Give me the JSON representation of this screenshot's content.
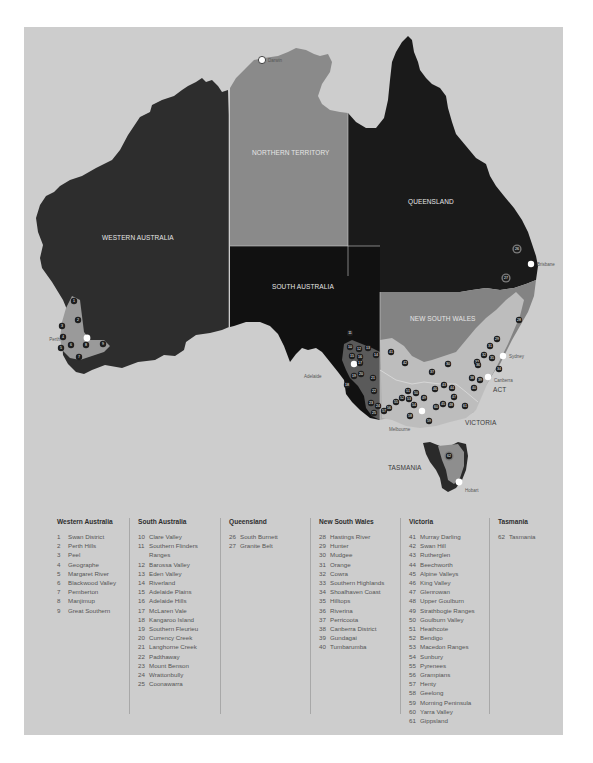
{
  "map": {
    "colors": {
      "background": "#cdcdcd",
      "western_australia": "#2d2d2d",
      "northern_territory": "#8a8a8a",
      "south_australia": "#111111",
      "queensland": "#1a1a1a",
      "new_south_wales": "#838383",
      "victoria": "#a9a9a9",
      "tasmania": "#2a2a2a",
      "wine_region": "#9a9a9a",
      "marker": "#1e1e1e",
      "city": "#ffffff"
    },
    "states": [
      {
        "id": "wa",
        "label": "WESTERN AUSTRALIA"
      },
      {
        "id": "nt",
        "label": "NORTHERN TERRITORY"
      },
      {
        "id": "sa",
        "label": "SOUTH AUSTRALIA"
      },
      {
        "id": "qld",
        "label": "QUEENSLAND"
      },
      {
        "id": "nsw",
        "label": "NEW SOUTH WALES"
      },
      {
        "id": "vic",
        "label": "VICTORIA"
      },
      {
        "id": "tas",
        "label": "TASMANIA"
      },
      {
        "id": "act",
        "label": "ACT"
      }
    ],
    "cities": [
      {
        "name": "Darwin"
      },
      {
        "name": "Perth"
      },
      {
        "name": "Adelaide"
      },
      {
        "name": "Brisbane"
      },
      {
        "name": "Sydney"
      },
      {
        "name": "Canberra"
      },
      {
        "name": "Melbourne"
      },
      {
        "name": "Hobart"
      }
    ],
    "markers": [
      {
        "n": "1",
        "x": 74,
        "y": 301
      },
      {
        "n": "2",
        "x": 78,
        "y": 320
      },
      {
        "n": "3",
        "x": 62,
        "y": 326
      },
      {
        "n": "4",
        "x": 63,
        "y": 337
      },
      {
        "n": "5",
        "x": 61,
        "y": 348
      },
      {
        "n": "6",
        "x": 71,
        "y": 345
      },
      {
        "n": "7",
        "x": 79,
        "y": 357
      },
      {
        "n": "8",
        "x": 86,
        "y": 345
      },
      {
        "n": "9",
        "x": 103,
        "y": 344
      },
      {
        "n": "10",
        "x": 350,
        "y": 347
      },
      {
        "n": "11",
        "x": 350,
        "y": 333
      },
      {
        "n": "12",
        "x": 359,
        "y": 349
      },
      {
        "n": "13",
        "x": 368,
        "y": 348
      },
      {
        "n": "14",
        "x": 376,
        "y": 355
      },
      {
        "n": "15",
        "x": 352,
        "y": 356
      },
      {
        "n": "16",
        "x": 360,
        "y": 357
      },
      {
        "n": "17",
        "x": 360,
        "y": 363
      },
      {
        "n": "18",
        "x": 347,
        "y": 385
      },
      {
        "n": "19",
        "x": 354,
        "y": 376
      },
      {
        "n": "20",
        "x": 361,
        "y": 374
      },
      {
        "n": "21",
        "x": 373,
        "y": 378
      },
      {
        "n": "22",
        "x": 374,
        "y": 391
      },
      {
        "n": "23",
        "x": 371,
        "y": 403
      },
      {
        "n": "24",
        "x": 378,
        "y": 406
      },
      {
        "n": "25",
        "x": 374,
        "y": 413
      },
      {
        "n": "26",
        "x": 517,
        "y": 249
      },
      {
        "n": "27",
        "x": 506,
        "y": 278
      },
      {
        "n": "28",
        "x": 519,
        "y": 320
      },
      {
        "n": "29",
        "x": 497,
        "y": 339
      },
      {
        "n": "30",
        "x": 448,
        "y": 364
      },
      {
        "n": "31",
        "x": 490,
        "y": 346
      },
      {
        "n": "32",
        "x": 484,
        "y": 355
      },
      {
        "n": "33",
        "x": 477,
        "y": 362
      },
      {
        "n": "34",
        "x": 499,
        "y": 369
      },
      {
        "n": "35",
        "x": 492,
        "y": 358
      },
      {
        "n": "36",
        "x": 478,
        "y": 365
      },
      {
        "n": "37",
        "x": 432,
        "y": 372
      },
      {
        "n": "38",
        "x": 472,
        "y": 378
      },
      {
        "n": "39",
        "x": 480,
        "y": 380
      },
      {
        "n": "40",
        "x": 474,
        "y": 388
      },
      {
        "n": "41",
        "x": 391,
        "y": 352
      },
      {
        "n": "42",
        "x": 405,
        "y": 363
      },
      {
        "n": "43",
        "x": 444,
        "y": 385
      },
      {
        "n": "44",
        "x": 452,
        "y": 388
      },
      {
        "n": "45",
        "x": 443,
        "y": 404
      },
      {
        "n": "46",
        "x": 435,
        "y": 389
      },
      {
        "n": "47",
        "x": 454,
        "y": 397
      },
      {
        "n": "48",
        "x": 451,
        "y": 405
      },
      {
        "n": "49",
        "x": 424,
        "y": 398
      },
      {
        "n": "50",
        "x": 416,
        "y": 393
      },
      {
        "n": "51",
        "x": 408,
        "y": 391
      },
      {
        "n": "52",
        "x": 402,
        "y": 398
      },
      {
        "n": "53",
        "x": 409,
        "y": 399
      },
      {
        "n": "54",
        "x": 414,
        "y": 405
      },
      {
        "n": "55",
        "x": 396,
        "y": 402
      },
      {
        "n": "56",
        "x": 389,
        "y": 408
      },
      {
        "n": "57",
        "x": 384,
        "y": 411
      },
      {
        "n": "58",
        "x": 410,
        "y": 416
      },
      {
        "n": "59",
        "x": 429,
        "y": 421
      },
      {
        "n": "60",
        "x": 436,
        "y": 407
      },
      {
        "n": "61",
        "x": 465,
        "y": 406
      },
      {
        "n": "62",
        "x": 449,
        "y": 456
      }
    ]
  },
  "legend": {
    "columns": [
      {
        "title": "Western Australia",
        "items": [
          {
            "num": "1",
            "name": "Swan District"
          },
          {
            "num": "2",
            "name": "Perth Hills"
          },
          {
            "num": "3",
            "name": "Peel"
          },
          {
            "num": "4",
            "name": "Geographe"
          },
          {
            "num": "5",
            "name": "Margaret River"
          },
          {
            "num": "6",
            "name": "Blackwood Valley"
          },
          {
            "num": "7",
            "name": "Pemberton"
          },
          {
            "num": "8",
            "name": "Manjimup"
          },
          {
            "num": "9",
            "name": "Great Southern"
          }
        ]
      },
      {
        "title": "South Australia",
        "items": [
          {
            "num": "10",
            "name": "Clare Valley"
          },
          {
            "num": "11",
            "name": "Southern Flinders"
          },
          {
            "num": "",
            "name": "Ranges"
          },
          {
            "num": "12",
            "name": "Barossa Valley"
          },
          {
            "num": "13",
            "name": "Eden Valley"
          },
          {
            "num": "14",
            "name": "Riverland"
          },
          {
            "num": "15",
            "name": "Adelaide Plains"
          },
          {
            "num": "16",
            "name": "Adelaide Hills"
          },
          {
            "num": "17",
            "name": "McLaren Vale"
          },
          {
            "num": "18",
            "name": "Kangaroo Island"
          },
          {
            "num": "19",
            "name": "Southern Fleurieu"
          },
          {
            "num": "20",
            "name": "Currency Creek"
          },
          {
            "num": "21",
            "name": "Langhorne Creek"
          },
          {
            "num": "22",
            "name": "Padthaway"
          },
          {
            "num": "23",
            "name": "Mount Benson"
          },
          {
            "num": "24",
            "name": "Wrattonbully"
          },
          {
            "num": "25",
            "name": "Coonawarra"
          }
        ]
      },
      {
        "title": "Queensland",
        "items": [
          {
            "num": "26",
            "name": "South Burnett"
          },
          {
            "num": "27",
            "name": "Granite Belt"
          }
        ]
      },
      {
        "title": "New South Wales",
        "items": [
          {
            "num": "28",
            "name": "Hastings River"
          },
          {
            "num": "29",
            "name": "Hunter"
          },
          {
            "num": "30",
            "name": "Mudgee"
          },
          {
            "num": "31",
            "name": "Orange"
          },
          {
            "num": "32",
            "name": "Cowra"
          },
          {
            "num": "33",
            "name": "Southern Highlands"
          },
          {
            "num": "34",
            "name": "Shoalhaven Coast"
          },
          {
            "num": "35",
            "name": "Hilltops"
          },
          {
            "num": "36",
            "name": "Riverina"
          },
          {
            "num": "37",
            "name": "Perricoota"
          },
          {
            "num": "38",
            "name": "Canberra District"
          },
          {
            "num": "39",
            "name": "Gundagai"
          },
          {
            "num": "40",
            "name": "Tumbarumba"
          }
        ]
      },
      {
        "title": "Victoria",
        "items": [
          {
            "num": "41",
            "name": "Murray Darling"
          },
          {
            "num": "42",
            "name": "Swan Hill"
          },
          {
            "num": "43",
            "name": "Rutherglen"
          },
          {
            "num": "44",
            "name": "Beechworth"
          },
          {
            "num": "45",
            "name": "Alpine Valleys"
          },
          {
            "num": "46",
            "name": "King Valley"
          },
          {
            "num": "47",
            "name": "Glenrowan"
          },
          {
            "num": "48",
            "name": "Upper Goulburn"
          },
          {
            "num": "49",
            "name": "Strathbogie Ranges"
          },
          {
            "num": "50",
            "name": "Goulburn Valley"
          },
          {
            "num": "51",
            "name": "Heathcote"
          },
          {
            "num": "52",
            "name": "Bendigo"
          },
          {
            "num": "53",
            "name": "Macedon Ranges"
          },
          {
            "num": "54",
            "name": "Sunbury"
          },
          {
            "num": "55",
            "name": "Pyrenees"
          },
          {
            "num": "56",
            "name": "Grampians"
          },
          {
            "num": "57",
            "name": "Henty"
          },
          {
            "num": "58",
            "name": "Geelong"
          },
          {
            "num": "59",
            "name": "Morning Peninsula"
          },
          {
            "num": "60",
            "name": "Yarra Valley"
          },
          {
            "num": "61",
            "name": "Gippsland"
          }
        ]
      },
      {
        "title": "Tasmania",
        "items": [
          {
            "num": "62",
            "name": "Tasmania"
          }
        ]
      }
    ]
  }
}
